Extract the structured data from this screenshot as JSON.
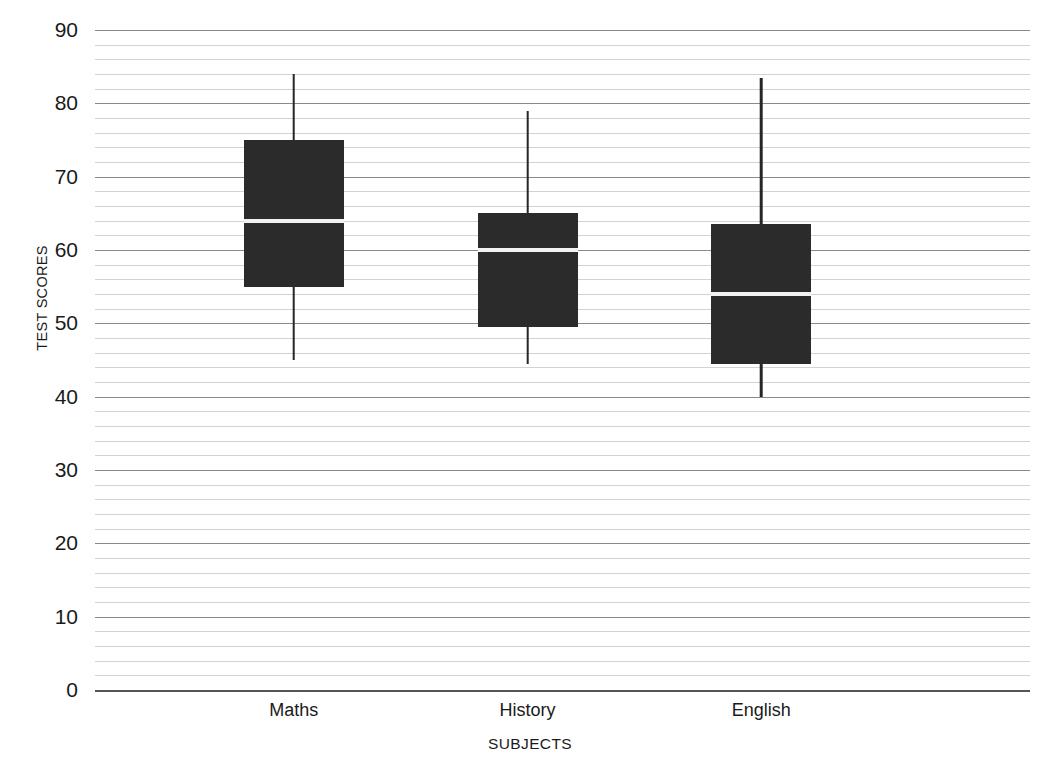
{
  "chart_data": {
    "type": "box",
    "title": "",
    "xlabel": "SUBJECTS",
    "ylabel": "TEST SCORES",
    "categories": [
      "Maths",
      "History",
      "English"
    ],
    "ylim": [
      0,
      90
    ],
    "ytick_step": 10,
    "yticks": [
      90,
      80,
      70,
      60,
      50,
      40,
      30,
      20,
      10,
      0
    ],
    "ytick_labels": [
      "90",
      "80",
      "70",
      "60",
      "50",
      "40",
      "30",
      "20",
      "10",
      "0"
    ],
    "minor_gridline_step": 2,
    "grid": true,
    "legend": "none",
    "colors": {
      "box_fill": "#2b2b2b",
      "median": "#f2f2f2",
      "whisker": "#262626",
      "major_gridline": "#8a8a8a",
      "minor_gridline": "#d2d2d2",
      "background": "#ffffff"
    },
    "boxes": [
      {
        "category": "Maths",
        "min": 45,
        "q1": 55,
        "median": 64,
        "q3": 75,
        "max": 84
      },
      {
        "category": "History",
        "min": 44.5,
        "q1": 49.5,
        "median": 60,
        "q3": 65,
        "max": 79
      },
      {
        "category": "English",
        "min": 40,
        "q1": 44.5,
        "median": 54,
        "q3": 63.5,
        "max": 83.5
      }
    ]
  }
}
